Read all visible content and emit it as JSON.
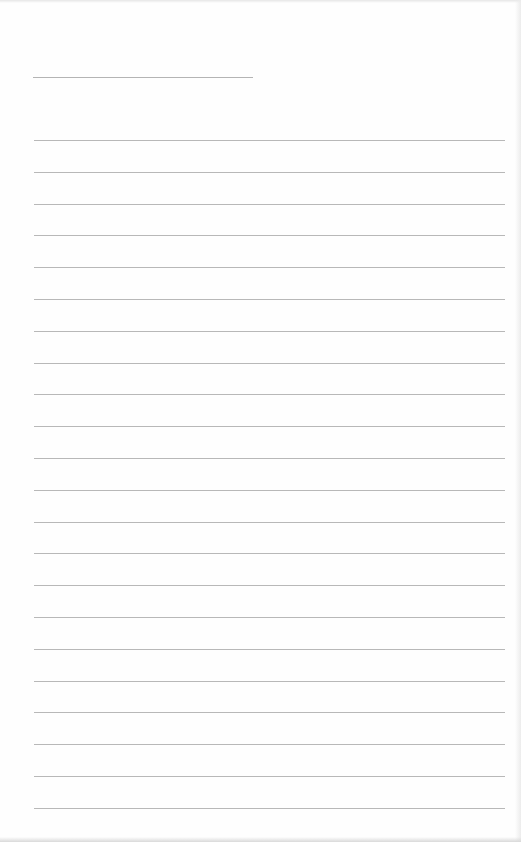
{
  "document": {
    "type": "lined-paper",
    "header_line": {
      "present": true,
      "left": 33,
      "top": 77,
      "width": 220
    },
    "rules": {
      "count": 22,
      "first_top": 140,
      "spacing": 31.8,
      "left": 34,
      "width": 471,
      "color": "#b8b8b8"
    },
    "background_color": "#fefefe",
    "text_content": []
  }
}
